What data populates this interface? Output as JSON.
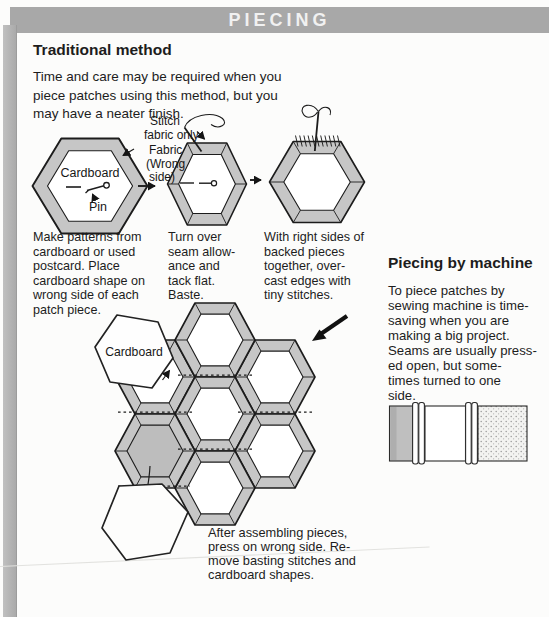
{
  "colors": {
    "header_bar": "#a8a8a8",
    "page_margin_strip": "#b3b3b3",
    "hexagon_fabric": "#c6c6c6",
    "solid_gray_patch": "#bdbdbd",
    "ink": "#1c1c1c"
  },
  "header": {
    "title": "PIECING"
  },
  "traditional": {
    "title": "Traditional method",
    "intro": "Time and care may be required when you\npiece patches using this method, but you\nmay have a neater finish.",
    "figure": {
      "label_stitch_1": "Stitch",
      "label_stitch_2": "fabric only",
      "label_fabric_1": "Fabric",
      "label_fabric_2": "(Wrong",
      "label_fabric_3": "side)",
      "label_cardboard": "Cardboard",
      "label_pin": "Pin"
    },
    "steps": {
      "step1": "Make patterns from\ncardboard or used\npostcard. Place\ncardboard shape on\nwrong side of each\npatch piece.",
      "step2": "Turn over\nseam allow-\nance and\ntack flat.\nBaste.",
      "step3": "With right sides of\nbacked pieces\ntogether, over-\ncast edges with\ntiny stitches."
    },
    "assembly": {
      "label_cardboard": "Cardboard",
      "caption": "After assembling pieces,\npress on wrong side. Re-\nmove basting stitches and\ncardboard shapes."
    }
  },
  "machine": {
    "title": "Piecing by machine",
    "body": "To piece patches by\nsewing machine is time-\nsaving when you are\nmaking a big project.\nSeams are usually press-\ned open, but some-\ntimes turned to one\nside."
  }
}
